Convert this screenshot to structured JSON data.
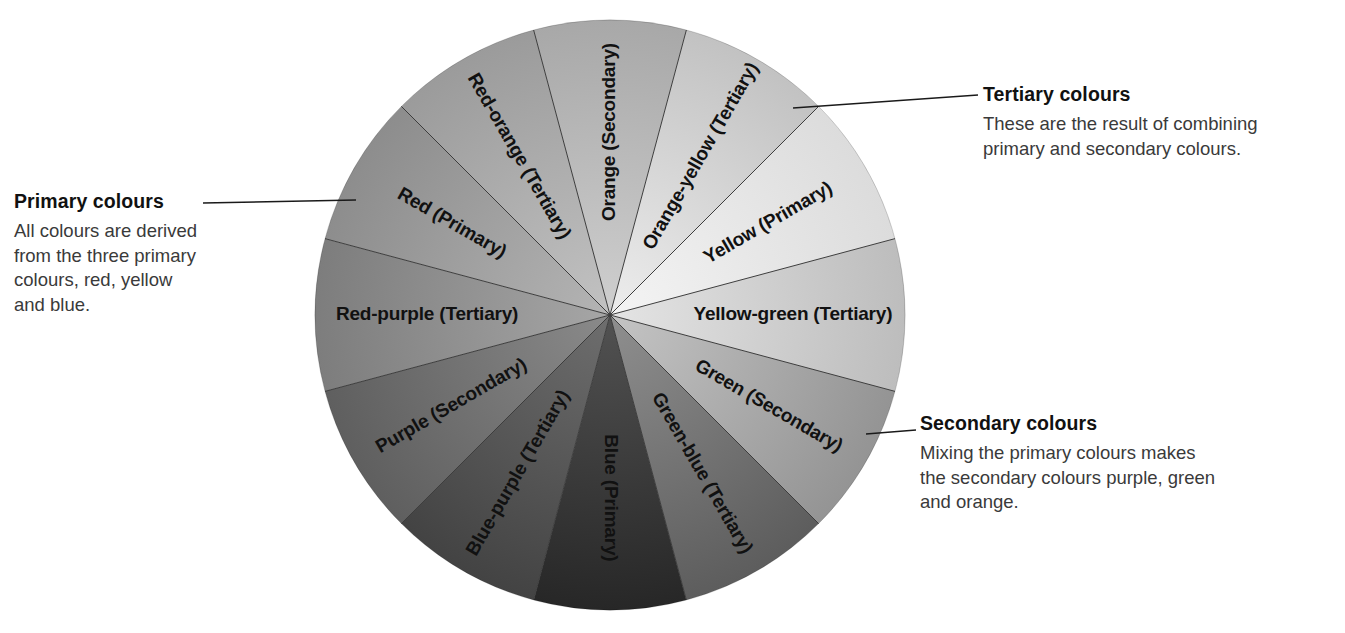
{
  "diagram": {
    "type": "colour-wheel",
    "segment_count": 12,
    "segment_angle_degrees": 30,
    "center": {
      "x": 610,
      "y": 315
    },
    "radius": 295,
    "rendering": "grayscale",
    "segments": [
      {
        "label": "Orange (Secondary)",
        "name": "Orange",
        "category": "Secondary",
        "center_angle": 0,
        "fill_start": "#cfcfcf",
        "fill_end": "#a8a8a8"
      },
      {
        "label": "Orange-yellow (Tertiary)",
        "name": "Orange-yellow",
        "category": "Tertiary",
        "center_angle": 30,
        "fill_start": "#ededed",
        "fill_end": "#c2c2c2"
      },
      {
        "label": "Yellow (Primary)",
        "name": "Yellow",
        "category": "Primary",
        "center_angle": 60,
        "fill_start": "#f4f4f4",
        "fill_end": "#dcdcdc"
      },
      {
        "label": "Yellow-green (Tertiary)",
        "name": "Yellow-green",
        "category": "Tertiary",
        "center_angle": 90,
        "fill_start": "#e4e4e4",
        "fill_end": "#bdbdbd"
      },
      {
        "label": "Green (Secondary)",
        "name": "Green",
        "category": "Secondary",
        "center_angle": 120,
        "fill_start": "#c4c4c4",
        "fill_end": "#949494"
      },
      {
        "label": "Green-blue (Tertiary)",
        "name": "Green-blue",
        "category": "Tertiary",
        "center_angle": 150,
        "fill_start": "#8f8f8f",
        "fill_end": "#5d5d5d"
      },
      {
        "label": "Blue (Primary)",
        "name": "Blue",
        "category": "Primary",
        "center_angle": 180,
        "fill_start": "#525252",
        "fill_end": "#272727"
      },
      {
        "label": "Blue-purple (Tertiary)",
        "name": "Blue-purple",
        "category": "Tertiary",
        "center_angle": 210,
        "fill_start": "#6e6e6e",
        "fill_end": "#434343"
      },
      {
        "label": "Purple (Secondary)",
        "name": "Purple",
        "category": "Secondary",
        "center_angle": 240,
        "fill_start": "#8a8a8a",
        "fill_end": "#5f5f5f"
      },
      {
        "label": "Red-purple (Tertiary)",
        "name": "Red-purple",
        "category": "Tertiary",
        "center_angle": 270,
        "fill_start": "#a6a6a6",
        "fill_end": "#7d7d7d"
      },
      {
        "label": "Red (Primary)",
        "name": "Red",
        "category": "Primary",
        "center_angle": 300,
        "fill_start": "#b4b4b4",
        "fill_end": "#8d8d8d"
      },
      {
        "label": "Red-orange (Tertiary)",
        "name": "Red-orange",
        "category": "Tertiary",
        "center_angle": 330,
        "fill_start": "#c2c2c2",
        "fill_end": "#9b9b9b"
      }
    ]
  },
  "callouts": {
    "primary": {
      "title": "Primary colours",
      "lines": [
        "All colours are derived",
        "from the three primary",
        "colours, red, yellow",
        "and blue."
      ]
    },
    "tertiary": {
      "title": "Tertiary colours",
      "lines": [
        "These are the result of combining",
        "primary and secondary colours."
      ]
    },
    "secondary": {
      "title": "Secondary colours",
      "lines": [
        "Mixing the primary colours makes",
        "the secondary colours purple, green",
        "and orange."
      ]
    }
  },
  "colors": {
    "background": "#ffffff",
    "text": "#111111",
    "body_text": "#3a3a3a",
    "leader_line": "#1a1a1a",
    "sector_divider": "#3d3d3d"
  }
}
